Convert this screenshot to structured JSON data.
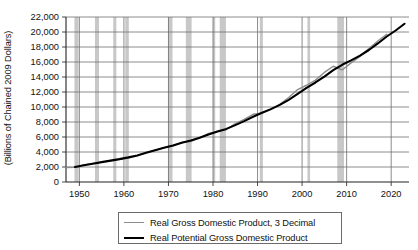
{
  "chart_data": {
    "type": "line",
    "title": "",
    "xlabel": "",
    "ylabel": "(Billions of Chained 2009 Dollars)",
    "ylim": [
      0,
      22000
    ],
    "xlim": [
      1947,
      2024
    ],
    "ytick_labels": [
      "22,000",
      "20,000",
      "18,000",
      "16,000",
      "14,000",
      "12,000",
      "10,000",
      "8,000",
      "6,000",
      "4,000",
      "2,000",
      "0"
    ],
    "ytick_values": [
      22000,
      20000,
      18000,
      16000,
      14000,
      12000,
      10000,
      8000,
      6000,
      4000,
      2000,
      0
    ],
    "xtick_labels": [
      "1950",
      "1960",
      "1970",
      "1980",
      "1990",
      "2000",
      "2010",
      "2020"
    ],
    "xtick_values": [
      1950,
      1960,
      1970,
      1980,
      1990,
      2000,
      2010,
      2020
    ],
    "grid": true,
    "legend_position": "below-center",
    "series": [
      {
        "name": "Real Gross Domestic Product, 3 Decimal",
        "color": "#8d8d8d",
        "width": 1.4,
        "x": [
          1947,
          1949,
          1951,
          1953,
          1955,
          1957,
          1959,
          1961,
          1963,
          1965,
          1967,
          1969,
          1971,
          1973,
          1975,
          1977,
          1979,
          1981,
          1983,
          1985,
          1987,
          1989,
          1991,
          1993,
          1995,
          1997,
          1999,
          2001,
          2003,
          2005,
          2007,
          2009,
          2011,
          2013,
          2015,
          2017,
          2019
        ],
        "values": [
          1930,
          1950,
          2270,
          2480,
          2650,
          2830,
          3030,
          3200,
          3510,
          3940,
          4230,
          4590,
          4790,
          5290,
          5390,
          5890,
          6470,
          6730,
          7000,
          7790,
          8350,
          9030,
          9180,
          9700,
          10350,
          11260,
          12320,
          12900,
          13580,
          14610,
          15430,
          14940,
          15890,
          16750,
          17790,
          18800,
          19700
        ]
      },
      {
        "name": "Real Potential Gross Domestic Product",
        "color": "#000000",
        "width": 2.1,
        "x": [
          1949,
          1951,
          1953,
          1955,
          1957,
          1959,
          1961,
          1963,
          1965,
          1967,
          1969,
          1971,
          1973,
          1975,
          1977,
          1979,
          1981,
          1983,
          1985,
          1987,
          1989,
          1991,
          1993,
          1995,
          1997,
          1999,
          2001,
          2003,
          2005,
          2007,
          2009,
          2011,
          2013,
          2015,
          2017,
          2019,
          2021,
          2023
        ],
        "values": [
          2010,
          2230,
          2440,
          2650,
          2850,
          3050,
          3280,
          3540,
          3890,
          4240,
          4570,
          4860,
          5230,
          5530,
          5900,
          6320,
          6720,
          7080,
          7580,
          8120,
          8700,
          9230,
          9720,
          10280,
          10960,
          11750,
          12550,
          13270,
          14050,
          14920,
          15630,
          16210,
          16860,
          17600,
          18470,
          19400,
          20200,
          21100
        ]
      }
    ],
    "recessions": [
      {
        "start": 1948.9,
        "end": 1949.8
      },
      {
        "start": 1953.5,
        "end": 1954.4
      },
      {
        "start": 1957.6,
        "end": 1958.3
      },
      {
        "start": 1960.3,
        "end": 1961.1
      },
      {
        "start": 1969.9,
        "end": 1970.9
      },
      {
        "start": 1973.9,
        "end": 1975.2
      },
      {
        "start": 1980.0,
        "end": 1980.5
      },
      {
        "start": 1981.5,
        "end": 1982.9
      },
      {
        "start": 1990.5,
        "end": 1991.2
      },
      {
        "start": 2001.2,
        "end": 2001.8
      },
      {
        "start": 2007.9,
        "end": 2009.4
      }
    ],
    "recession_color": "#c8c8c8"
  },
  "legend": {
    "items": [
      {
        "label": "Real Gross Domestic Product, 3 Decimal"
      },
      {
        "label": "Real Potential Gross Domestic Product"
      }
    ]
  }
}
